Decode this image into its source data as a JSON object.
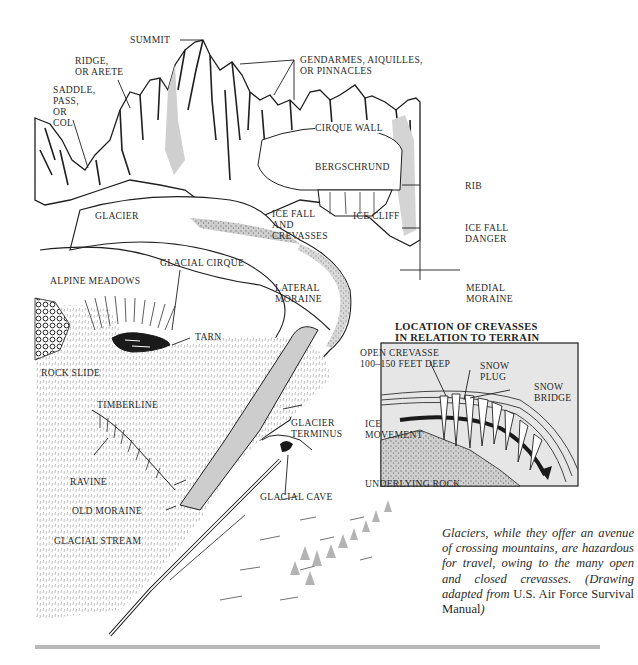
{
  "figure": {
    "labels": {
      "summit": "SUMMIT",
      "ridge": "RIDGE,\nOR ARETE",
      "saddle": "SADDLE,\nPASS,\nOR\nCOL",
      "gendarmes": "GENDARMES, AIQUILLES,\nOR PINNACLES",
      "cirque_wall": "CIRQUE WALL",
      "bergschrund": "BERGSCHRUND",
      "rib": "RIB",
      "glacier": "GLACIER",
      "ice_fall_crevasses": "ICE FALL\nAND\nCREVASSES",
      "ice_cliff": "ICE CLIFF",
      "ice_fall_danger": "ICE FALL\nDANGER",
      "alpine_meadows": "ALPINE MEADOWS",
      "glacial_cirque": "GLACIAL CIRQUE",
      "lateral_moraine": "LATERAL\nMORAINE",
      "medial_moraine": "MEDIAL\nMORAINE",
      "tarn": "TARN",
      "rock_slide": "ROCK SLIDE",
      "timberline": "TIMBERLINE",
      "glacier_terminus": "GLACIER\nTERMINUS",
      "ravine": "RAVINE",
      "old_moraine": "OLD MORAINE",
      "glacial_cave": "GLACIAL CAVE",
      "glacial_stream": "GLACIAL STREAM"
    },
    "inset": {
      "title": "LOCATION OF CREVASSES\nIN RELATION TO TERRAIN",
      "open_crevasse": "OPEN CREVASSE\n100–150 FEET DEEP",
      "snow_plug": "SNOW\nPLUG",
      "snow_bridge": "SNOW\nBRIDGE",
      "ice_movement": "ICE\nMOVEMENT",
      "underlying_rock": "UNDERLYING ROCK"
    },
    "caption": {
      "italic_part": "Glaciers, while they offer an avenue of crossing mountains, are hazardous for travel, owing to the many open and closed crevasses. (Drawing adapted from ",
      "roman_part": "U.S. Air Force Survival Manual",
      "closing": ")"
    }
  },
  "colors": {
    "ink": "#1e1e1e",
    "label_text": "#2a2a2a",
    "shade_gray": "#b5b5b5",
    "light_gray": "#d6d6d6",
    "inset_bg": "#e6e6e6",
    "rule": "#b9b9b9"
  }
}
